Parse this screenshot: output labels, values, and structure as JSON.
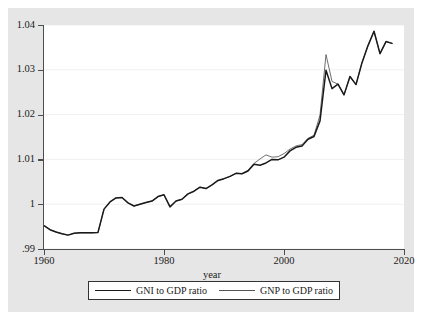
{
  "chart_data": {
    "type": "line",
    "title": "",
    "xlabel": "year",
    "ylabel": "",
    "xlim": [
      1960,
      2020
    ],
    "ylim": [
      0.99,
      1.04
    ],
    "grid": true,
    "legend_position": "bottom",
    "xticks": [
      1960,
      1980,
      2000,
      2020
    ],
    "xtick_labels": [
      "1960",
      "1980",
      "2000",
      "2020"
    ],
    "yticks": [
      0.99,
      1.0,
      1.01,
      1.02,
      1.03,
      1.04
    ],
    "ytick_labels": [
      ".99",
      "1",
      "1.01",
      "1.02",
      "1.03",
      "1.04"
    ],
    "x": [
      1960,
      1961,
      1962,
      1963,
      1964,
      1965,
      1966,
      1967,
      1968,
      1969,
      1970,
      1971,
      1972,
      1973,
      1974,
      1975,
      1976,
      1977,
      1978,
      1979,
      1980,
      1981,
      1982,
      1983,
      1984,
      1985,
      1986,
      1987,
      1988,
      1989,
      1990,
      1991,
      1992,
      1993,
      1994,
      1995,
      1996,
      1997,
      1998,
      1999,
      2000,
      2001,
      2002,
      2003,
      2004,
      2005,
      2006,
      2007,
      2008,
      2009,
      2010,
      2011,
      2012,
      2013,
      2014,
      2015,
      2016,
      2017,
      2018
    ],
    "series": [
      {
        "name": "GNI to GDP ratio",
        "values": [
          0.9952,
          0.9943,
          0.9938,
          0.9934,
          0.9931,
          0.9935,
          0.9936,
          0.9936,
          0.9936,
          0.9937,
          0.9989,
          1.0005,
          1.0014,
          1.0015,
          1.0003,
          0.9996,
          1.0,
          1.0004,
          1.0007,
          1.0017,
          1.0021,
          0.9994,
          1.0007,
          1.0011,
          1.0023,
          1.0029,
          1.0038,
          1.0035,
          1.0043,
          1.0053,
          1.0057,
          1.0062,
          1.0069,
          1.0068,
          1.0074,
          1.0089,
          1.0087,
          1.0092,
          1.01,
          1.0099,
          1.0105,
          1.0119,
          1.0127,
          1.013,
          1.0145,
          1.0151,
          1.0186,
          1.0299,
          1.0258,
          1.0268,
          1.0244,
          1.0285,
          1.0267,
          1.0316,
          1.0354,
          1.0386,
          1.0336,
          1.0363,
          1.0359
        ]
      },
      {
        "name": "GNP to GDP ratio",
        "values": [
          0.9952,
          0.9943,
          0.9938,
          0.9934,
          0.9931,
          0.9935,
          0.9936,
          0.9936,
          0.9936,
          0.9937,
          0.9989,
          1.0005,
          1.0014,
          1.0015,
          1.0003,
          0.9996,
          1.0,
          1.0004,
          1.0007,
          1.0017,
          1.0021,
          0.9994,
          1.0007,
          1.0011,
          1.0023,
          1.0029,
          1.0038,
          1.0035,
          1.0043,
          1.0053,
          1.0057,
          1.0062,
          1.0069,
          1.0068,
          1.0076,
          1.0091,
          1.0101,
          1.011,
          1.0105,
          1.0106,
          1.0113,
          1.0123,
          1.013,
          1.0133,
          1.0147,
          1.0154,
          1.0199,
          1.0334,
          1.0274,
          1.0268,
          1.0244,
          1.0285,
          1.0267,
          1.0316,
          1.0354,
          1.0386,
          1.0336,
          1.0363,
          1.0359
        ]
      }
    ],
    "colors": {
      "series_1": "#1a1a1a",
      "series_2": "#555555",
      "plot_background": "#ffffff",
      "graph_background": "#e6e6e6",
      "gridline": "#f0f0f0",
      "axis": "#4d4d4d"
    }
  },
  "axis": {
    "x_title": "year"
  },
  "legend": {
    "items": [
      {
        "label": "GNI to GDP ratio",
        "style": "thick"
      },
      {
        "label": "GNP to GDP ratio",
        "style": "thin"
      }
    ]
  }
}
